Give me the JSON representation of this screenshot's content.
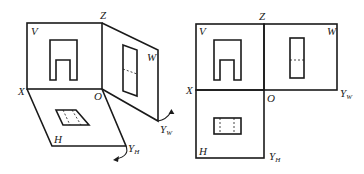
{
  "left_figure": {
    "description": "Three-plane projection system (unfolding view)",
    "labels": {
      "V": "V",
      "Z": "Z",
      "W": "W",
      "X": "X",
      "O": "O",
      "H": "H",
      "Y": "Y",
      "H_sub": "H",
      "W_sub": "W"
    }
  },
  "right_figure": {
    "description": "Three-plane projection system (unfolded)",
    "labels": {
      "V": "V",
      "Z": "Z",
      "W": "W",
      "X": "X",
      "O": "O",
      "H": "H",
      "Y": "Y",
      "H_sub": "H",
      "W_sub": "W"
    }
  }
}
